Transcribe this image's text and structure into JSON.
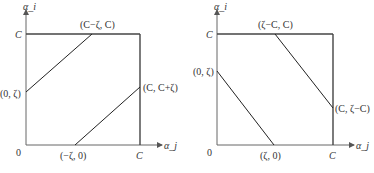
{
  "left_panel": {
    "y_axis_label": "α_i",
    "x_axis_label": "α_j",
    "origin_label": "0",
    "y_tick_label": "C",
    "x_tick_label": "C",
    "points": {
      "top": "(C−ζ, C)",
      "left": "(0, ζ)",
      "right": "(C, C+ζ)",
      "bottom": "(−ζ, 0)"
    }
  },
  "right_panel": {
    "y_axis_label": "α_i",
    "x_axis_label": "α_j",
    "origin_label": "0",
    "y_tick_label": "C",
    "x_tick_label": "C",
    "points": {
      "top": "(ζ−C, C)",
      "left": "(0, ζ)",
      "right": "(C, ζ−C)",
      "bottom": "(ζ, 0)"
    }
  },
  "colors": {
    "axis": "#555555",
    "line": "#222222",
    "box": "#444444"
  }
}
